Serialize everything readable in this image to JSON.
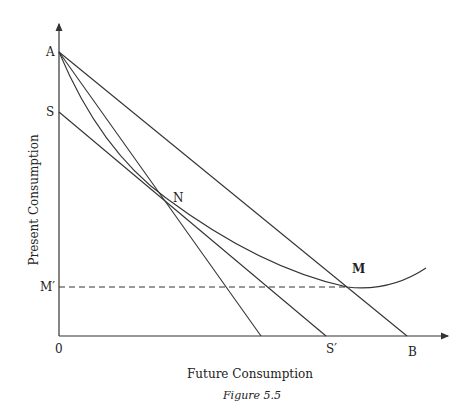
{
  "figure": {
    "caption": "Figure 5.5",
    "xlabel": "Future Consumption",
    "ylabel": "Present Consumption"
  },
  "labels": {
    "A": "A",
    "S": "S",
    "N": "N",
    "M": "M",
    "M_prime": "M′",
    "origin": "0",
    "S_prime": "S′",
    "B": "B"
  },
  "colors": {
    "line": "#333333",
    "background": "#ffffff"
  }
}
